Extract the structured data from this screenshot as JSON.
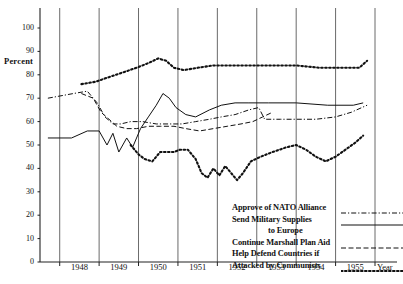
{
  "chart_data": {
    "type": "line",
    "title": "",
    "xlabel": "Year",
    "ylabel": "Percent",
    "ylim": [
      0,
      100
    ],
    "ytick_values": [
      0,
      10,
      20,
      30,
      40,
      50,
      60,
      70,
      80,
      90,
      100
    ],
    "xlim": [
      1947.5,
      1956.0
    ],
    "categories": [
      "1948",
      "1949",
      "1950",
      "1951",
      "1952",
      "1953",
      "1954",
      "1955"
    ],
    "grid": "vertical-year-boundaries",
    "legend_position": "inside-lower-right",
    "series": [
      {
        "name": "Approve of NATO Alliance",
        "style": "dash-dot",
        "points": [
          [
            1947.7,
            70
          ],
          [
            1948.35,
            72
          ],
          [
            1948.7,
            73
          ],
          [
            1948.95,
            68
          ],
          [
            1949.15,
            62
          ],
          [
            1949.35,
            59
          ],
          [
            1949.55,
            59
          ],
          [
            1949.8,
            60
          ],
          [
            1950.1,
            60
          ],
          [
            1950.45,
            59
          ],
          [
            1950.8,
            59
          ],
          [
            1951.1,
            59
          ],
          [
            1951.45,
            60
          ],
          [
            1951.8,
            61
          ],
          [
            1952.1,
            62
          ],
          [
            1952.45,
            63
          ],
          [
            1952.8,
            65
          ],
          [
            1953.05,
            66
          ],
          [
            1953.2,
            61
          ],
          [
            1953.6,
            61
          ],
          [
            1954.0,
            61
          ],
          [
            1954.5,
            61
          ],
          [
            1955.0,
            62
          ],
          [
            1955.4,
            64
          ],
          [
            1955.8,
            67
          ]
        ]
      },
      {
        "name": "Send Military Supplies to Europe",
        "style": "solid",
        "points": [
          [
            1947.7,
            53
          ],
          [
            1948.3,
            53
          ],
          [
            1948.7,
            56
          ],
          [
            1949.0,
            56
          ],
          [
            1949.2,
            50
          ],
          [
            1949.35,
            55
          ],
          [
            1949.5,
            47
          ],
          [
            1949.7,
            53
          ],
          [
            1949.85,
            49
          ],
          [
            1950.05,
            57
          ],
          [
            1950.25,
            62
          ],
          [
            1950.45,
            67
          ],
          [
            1950.62,
            72
          ],
          [
            1950.78,
            70
          ],
          [
            1950.95,
            66
          ],
          [
            1951.2,
            63
          ],
          [
            1951.45,
            62
          ],
          [
            1951.8,
            65
          ],
          [
            1952.1,
            67
          ],
          [
            1952.45,
            68
          ],
          [
            1952.8,
            68
          ],
          [
            1953.3,
            68
          ],
          [
            1954.0,
            68
          ],
          [
            1954.8,
            67
          ],
          [
            1955.45,
            67
          ],
          [
            1955.7,
            68
          ]
        ]
      },
      {
        "name": "Continue Marshall Plan Aid",
        "style": "dashed",
        "points": [
          [
            1948.55,
            72
          ],
          [
            1948.85,
            70
          ],
          [
            1949.05,
            64
          ],
          [
            1949.25,
            61
          ],
          [
            1949.45,
            58
          ],
          [
            1949.7,
            57
          ],
          [
            1949.95,
            57
          ],
          [
            1950.25,
            58
          ],
          [
            1950.55,
            58
          ],
          [
            1950.9,
            58
          ],
          [
            1951.2,
            57
          ],
          [
            1951.55,
            56
          ],
          [
            1951.9,
            57
          ],
          [
            1952.25,
            58
          ],
          [
            1952.6,
            59
          ],
          [
            1952.9,
            60
          ],
          [
            1953.15,
            62
          ],
          [
            1953.4,
            64
          ]
        ]
      },
      {
        "name": "Help Defend Countries if Attacked by Communists",
        "style": "dotted",
        "points": [
          [
            1948.55,
            76
          ],
          [
            1948.9,
            77
          ],
          [
            1949.25,
            79
          ],
          [
            1949.6,
            81
          ],
          [
            1949.95,
            83
          ],
          [
            1950.25,
            85
          ],
          [
            1950.5,
            87
          ],
          [
            1950.7,
            86
          ],
          [
            1950.9,
            83
          ],
          [
            1951.15,
            82
          ],
          [
            1951.5,
            83
          ],
          [
            1951.9,
            84
          ],
          [
            1952.3,
            84
          ],
          [
            1952.8,
            84
          ],
          [
            1953.4,
            84
          ],
          [
            1954.0,
            84
          ],
          [
            1954.6,
            83
          ],
          [
            1955.2,
            83
          ],
          [
            1955.6,
            83
          ],
          [
            1955.8,
            86
          ]
        ]
      },
      {
        "name": "Help Defend Countries if Attacked by Communists (lower)",
        "style": "dotted",
        "points": [
          [
            1949.8,
            50
          ],
          [
            1950.0,
            46
          ],
          [
            1950.15,
            44
          ],
          [
            1950.35,
            43
          ],
          [
            1950.55,
            47
          ],
          [
            1950.72,
            47
          ],
          [
            1950.9,
            47
          ],
          [
            1951.05,
            48
          ],
          [
            1951.25,
            48
          ],
          [
            1951.45,
            44
          ],
          [
            1951.6,
            38
          ],
          [
            1951.75,
            36
          ],
          [
            1951.9,
            40
          ],
          [
            1952.05,
            37
          ],
          [
            1952.2,
            41
          ],
          [
            1952.35,
            38
          ],
          [
            1952.5,
            35
          ],
          [
            1952.65,
            38
          ],
          [
            1952.85,
            43
          ],
          [
            1953.1,
            45
          ],
          [
            1953.4,
            47
          ],
          [
            1953.75,
            49
          ],
          [
            1954.0,
            50
          ],
          [
            1954.25,
            48
          ],
          [
            1954.5,
            45
          ],
          [
            1954.75,
            43
          ],
          [
            1955.0,
            45
          ],
          [
            1955.25,
            48
          ],
          [
            1955.5,
            51
          ],
          [
            1955.7,
            54
          ]
        ]
      }
    ]
  },
  "axis": {
    "ylabel": "Percent",
    "xlabel": "Year"
  },
  "legend": {
    "rows": [
      {
        "label": "Approve of NATO Alliance",
        "style": "dash-dot",
        "indent": false,
        "sample": true
      },
      {
        "label": "Send Military Supplies",
        "style": "solid",
        "indent": false,
        "sample": true
      },
      {
        "label": "to Europe",
        "style": "none",
        "indent": true,
        "sample": false
      },
      {
        "label": "Continue Marshall Plan Aid",
        "style": "dashed",
        "indent": false,
        "sample": true
      },
      {
        "label": "Help Defend Countries if",
        "style": "none",
        "indent": false,
        "sample": false
      },
      {
        "label": "Attacked by Communists",
        "style": "dotted",
        "indent": false,
        "sample": true
      }
    ]
  }
}
